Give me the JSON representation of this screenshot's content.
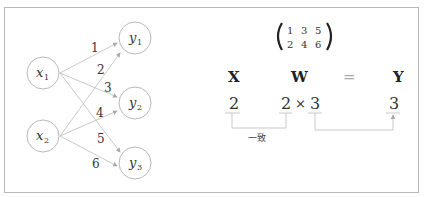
{
  "network": {
    "inputs": [
      {
        "label": "x",
        "sub": "1"
      },
      {
        "label": "x",
        "sub": "2"
      }
    ],
    "outputs": [
      {
        "label": "y",
        "sub": "1"
      },
      {
        "label": "y",
        "sub": "2"
      },
      {
        "label": "y",
        "sub": "3"
      }
    ],
    "weights": [
      "1",
      "2",
      "3",
      "4",
      "5",
      "6"
    ]
  },
  "matrix": {
    "rows": [
      [
        "1",
        "3",
        "5"
      ],
      [
        "2",
        "4",
        "6"
      ]
    ]
  },
  "equation": {
    "x": "X",
    "w": "W",
    "eq": "=",
    "y": "Y",
    "x_dim": "2",
    "w_dim1": "2",
    "times": "×",
    "w_dim2": "3",
    "y_dim": "3",
    "match_label": "一致"
  },
  "colors": {
    "circle_stroke": "#b0b0b0",
    "line": "#b8b8b8",
    "text": "#333333",
    "border": "#b8b8b8"
  }
}
